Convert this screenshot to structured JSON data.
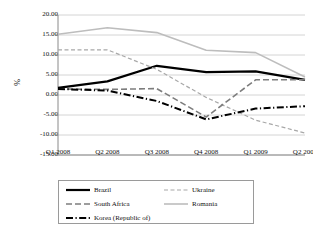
{
  "chart_data": {
    "type": "line",
    "title": "",
    "subtitle": "",
    "xlabel": "",
    "ylabel": "%",
    "categories": [
      "Q1 2008",
      "Q2 2008",
      "Q3 2008",
      "Q4 2008",
      "Q1 2009",
      "Q2 2009"
    ],
    "ylim": [
      -15.0,
      20.0
    ],
    "ytick_labels": [
      "20.00",
      "15.00",
      "10.00",
      "5.00",
      "0.00",
      "-5.00",
      "-10.00",
      "-15.00"
    ],
    "ytick_values": [
      20.0,
      15.0,
      10.0,
      5.0,
      0.0,
      -5.0,
      -10.0,
      -15.0
    ],
    "grid": true,
    "legend_position": "bottom",
    "series": [
      {
        "name": "Brazil",
        "color": "#000000",
        "style": "solid",
        "width": 2.2,
        "values": [
          1.8,
          3.4,
          7.3,
          5.7,
          5.9,
          3.8
        ]
      },
      {
        "name": "Ukraine",
        "color": "#a8a8a8",
        "style": "dashed",
        "width": 1.2,
        "values": [
          11.3,
          11.3,
          6.4,
          -0.6,
          -6.3,
          -9.5
        ]
      },
      {
        "name": "South Africa",
        "color": "#7d7d7d",
        "style": "dashed-long",
        "width": 1.6,
        "values": [
          1.5,
          1.4,
          1.6,
          -5.5,
          3.8,
          3.8
        ]
      },
      {
        "name": "Romania",
        "color": "#bdbdbd",
        "style": "solid",
        "width": 1.6,
        "values": [
          15.2,
          16.8,
          15.6,
          11.2,
          10.6,
          4.5
        ]
      },
      {
        "name": "Korea (Republic of)",
        "color": "#000000",
        "style": "dash-dot",
        "width": 2.0,
        "values": [
          1.5,
          1.1,
          -1.5,
          -6.1,
          -3.4,
          -2.8
        ]
      }
    ]
  },
  "legend": {
    "entries": [
      {
        "label": "Brazil"
      },
      {
        "label": "Ukraine"
      },
      {
        "label": "South Africa"
      },
      {
        "label": "Romania"
      },
      {
        "label": "Korea (Republic of)"
      }
    ]
  }
}
